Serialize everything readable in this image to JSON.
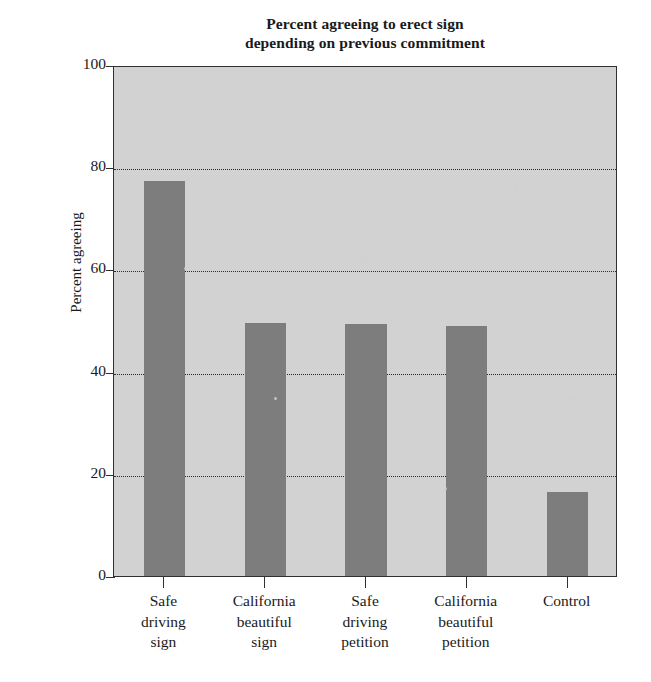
{
  "chart_data": {
    "type": "bar",
    "title": "Percent agreeing to erect sign depending on previous commitment",
    "title_lines": [
      "Percent agreeing to erect sign",
      "depending on previous commitment"
    ],
    "xlabel": "",
    "ylabel": "Percent agreeing",
    "ylim": [
      0,
      100
    ],
    "yticks": [
      0,
      20,
      40,
      60,
      80,
      100
    ],
    "ytick_labels": [
      "0",
      "20",
      "40",
      "60",
      "80",
      "100"
    ],
    "grid": "horizontal-dotted",
    "legend": "none",
    "categories": [
      "Safe driving sign",
      "California beautiful sign",
      "Safe driving petition",
      "California beautiful petition",
      "Control"
    ],
    "category_lines": [
      [
        "Safe",
        "driving",
        "sign"
      ],
      [
        "California",
        "beautiful",
        "sign"
      ],
      [
        "Safe",
        "driving",
        "petition"
      ],
      [
        "California",
        "beautiful",
        "petition"
      ],
      [
        "Control"
      ]
    ],
    "values": [
      77.3,
      49.5,
      49.3,
      49.0,
      16.5
    ],
    "bar_color": "#7d7d7d",
    "plot_background": "#d2d2d2",
    "axis_color": "#303030"
  }
}
